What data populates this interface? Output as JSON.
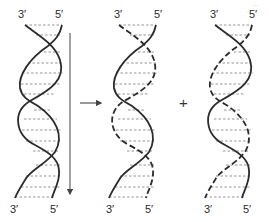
{
  "diagram": {
    "page_number": "...",
    "operator_plus": "+",
    "colors": {
      "strand": "#2b2b2b",
      "rung": "#777777",
      "arrow": "#444444"
    },
    "helices": [
      {
        "id": "parent",
        "top_left_label": "3′",
        "top_right_label": "5′",
        "bottom_left_label": "3′",
        "bottom_right_label": "5′",
        "strand_a_style": "solid",
        "strand_b_style": "solid",
        "has_direction_arrow": true
      },
      {
        "id": "daughter-1",
        "top_left_label": "3′",
        "top_right_label": "5′",
        "bottom_left_label": "3′",
        "bottom_right_label": "5′",
        "strand_a_style": "dashed",
        "strand_b_style": "solid"
      },
      {
        "id": "daughter-2",
        "top_left_label": "3′",
        "top_right_label": "5′",
        "bottom_left_label": "3′",
        "bottom_right_label": "5′",
        "strand_a_style": "solid",
        "strand_b_style": "dashed"
      }
    ]
  }
}
